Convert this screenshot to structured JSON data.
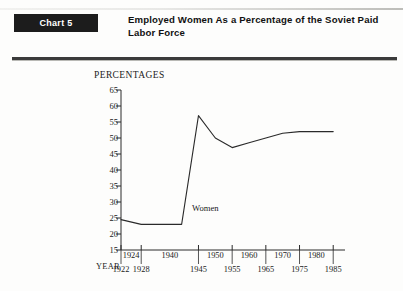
{
  "header": {
    "badge_label": "Chart 5",
    "title": "Employed Women As a Percentage of the Soviet Paid Labor Force"
  },
  "axis": {
    "y_axis_title": "PERCENTAGES",
    "x_axis_title": "YEAR"
  },
  "chart_data": {
    "type": "line",
    "title": "Employed Women As a Percentage of the Soviet Paid Labor Force",
    "xlabel": "YEAR",
    "ylabel": "PERCENTAGES",
    "ylim": [
      15,
      65
    ],
    "yticks": [
      15,
      20,
      25,
      30,
      35,
      40,
      45,
      50,
      55,
      60,
      65
    ],
    "grid": false,
    "legend": "none",
    "annotations": [
      "Women"
    ],
    "x_tick_labels_upper": [
      "1924",
      "1940",
      "1950",
      "1960",
      "1970",
      "1980"
    ],
    "x_tick_labels_lower": [
      "1922",
      "1928",
      "1945",
      "1955",
      "1965",
      "1975",
      "1985"
    ],
    "series": [
      {
        "name": "Women",
        "x": [
          1922,
          1928,
          1940,
          1945,
          1950,
          1955,
          1960,
          1965,
          1970,
          1975,
          1980,
          1985
        ],
        "values": [
          24.5,
          23.0,
          23.0,
          57.0,
          50.0,
          47.0,
          48.5,
          50.0,
          51.5,
          52.0,
          52.0,
          52.0
        ]
      }
    ]
  },
  "colors": {
    "badge_background": "#1c1c1c",
    "badge_text": "#ffffff",
    "rule": "#3b3b3b",
    "line": "#2a2a2a",
    "text": "#1b1b1b",
    "page_background": "#fdfdfc"
  }
}
